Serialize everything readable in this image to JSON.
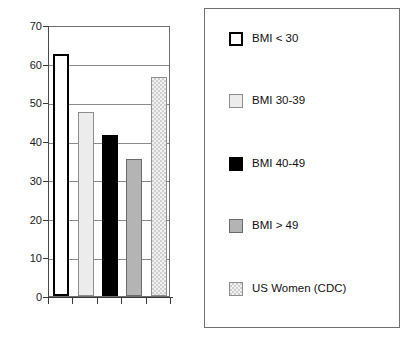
{
  "chart_data": {
    "type": "bar",
    "title": "",
    "subtitle": "",
    "xlabel": "",
    "ylabel": "",
    "ylim": [
      0,
      70
    ],
    "ytick_step": 10,
    "yticks": [
      "0",
      "10",
      "20",
      "30",
      "40",
      "50",
      "60",
      "70"
    ],
    "grid": true,
    "legend_position": "right",
    "categories": [
      "BMI < 30",
      "BMI 30-39",
      "BMI 40-49",
      "BMI > 49",
      "US Women (CDC)"
    ],
    "values": [
      62.5,
      47.5,
      41.7,
      35.5,
      56.5
    ],
    "bar_styles": [
      "white-outline",
      "very-light-gray",
      "solid-black",
      "medium-gray",
      "light-checkered"
    ],
    "series": [
      {
        "name": "Percent",
        "values": [
          62.5,
          47.5,
          41.7,
          35.5,
          56.5
        ]
      }
    ],
    "annotations": []
  },
  "colors": {
    "axis": "#3a3a3a",
    "gridline": "#8a8a8a",
    "plot_border": "#6f6f6f",
    "legend_border": "#707070",
    "bar_white": "#ffffff",
    "bar_very_light": "#ececec",
    "bar_black": "#000000",
    "bar_medium_gray": "#b4b4b4",
    "bar_checkered": "#e2e2e2",
    "text": "#111111",
    "background": "#ffffff"
  },
  "legend": {
    "items": [
      {
        "label": "BMI < 30",
        "style": "white-outline"
      },
      {
        "label": "BMI 30-39",
        "style": "very-light-gray"
      },
      {
        "label": "BMI 40-49",
        "style": "solid-black"
      },
      {
        "label": "BMI > 49",
        "style": "medium-gray"
      },
      {
        "label": "US Women (CDC)",
        "style": "light-checkered"
      }
    ]
  }
}
